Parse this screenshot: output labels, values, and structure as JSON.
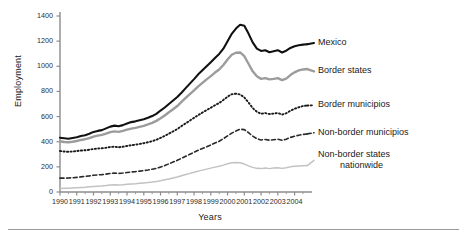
{
  "figure": {
    "bottom_rule": "horizontal-rule"
  },
  "chart_data": {
    "type": "line",
    "title": "",
    "xlabel": "Years",
    "ylabel": "Employment",
    "xlim": [
      1990,
      2004.92
    ],
    "ylim": [
      0,
      1400
    ],
    "grid": false,
    "legend_position": "right-of-line-ends",
    "yticks": [
      0,
      200,
      400,
      600,
      800,
      1000,
      1200,
      1400
    ],
    "ytick_labels": [
      "0",
      "200",
      "400",
      "600",
      "800",
      "1000",
      "1200",
      "1400"
    ],
    "xticks": [
      1990,
      1991,
      1992,
      1993,
      1994,
      1995,
      1996,
      1997,
      1998,
      1999,
      2000,
      2001,
      2002,
      2003,
      2004
    ],
    "xtick_labels": [
      "1990",
      "1991",
      "1992",
      "1993",
      "1994",
      "1995",
      "1996",
      "1997",
      "1998",
      "1999",
      "2000",
      "2001",
      "2002",
      "2003",
      "2004"
    ],
    "x": [
      1990.0,
      1990.25,
      1990.5,
      1990.75,
      1991.0,
      1991.25,
      1991.5,
      1991.75,
      1992.0,
      1992.25,
      1992.5,
      1992.75,
      1993.0,
      1993.25,
      1993.5,
      1993.75,
      1994.0,
      1994.25,
      1994.5,
      1994.75,
      1995.0,
      1995.25,
      1995.5,
      1995.75,
      1996.0,
      1996.25,
      1996.5,
      1996.75,
      1997.0,
      1997.25,
      1997.5,
      1997.75,
      1998.0,
      1998.25,
      1998.5,
      1998.75,
      1999.0,
      1999.25,
      1999.5,
      1999.75,
      2000.0,
      2000.25,
      2000.5,
      2000.75,
      2001.0,
      2001.25,
      2001.5,
      2001.75,
      2002.0,
      2002.25,
      2002.5,
      2002.75,
      2003.0,
      2003.25,
      2003.5,
      2003.75,
      2004.0,
      2004.25,
      2004.5,
      2004.75
    ],
    "series": [
      {
        "name": "Mexico",
        "style": "solid",
        "color": "#111111",
        "width": 2.1,
        "label_x": 2005.6,
        "label_y": 1185,
        "values": [
          432,
          428,
          424,
          430,
          436,
          445,
          452,
          463,
          478,
          486,
          492,
          506,
          520,
          528,
          523,
          532,
          545,
          556,
          562,
          570,
          578,
          590,
          604,
          622,
          648,
          672,
          700,
          728,
          756,
          790,
          826,
          862,
          898,
          936,
          968,
          1000,
          1032,
          1066,
          1098,
          1140,
          1200,
          1258,
          1300,
          1330,
          1322,
          1260,
          1190,
          1140,
          1122,
          1128,
          1112,
          1120,
          1128,
          1110,
          1124,
          1146,
          1160,
          1168,
          1172,
          1175
        ]
      },
      {
        "name": "Border states",
        "style": "solid",
        "color": "#9c9c9c",
        "width": 2.4,
        "label_x": 2005.6,
        "label_y": 960,
        "values": [
          404,
          398,
          396,
          400,
          406,
          414,
          420,
          428,
          440,
          448,
          454,
          464,
          476,
          482,
          478,
          486,
          496,
          504,
          510,
          518,
          526,
          538,
          550,
          566,
          586,
          608,
          634,
          658,
          684,
          716,
          748,
          778,
          808,
          840,
          868,
          896,
          922,
          950,
          974,
          1010,
          1054,
          1092,
          1108,
          1110,
          1080,
          1020,
          960,
          920,
          900,
          906,
          896,
          900,
          906,
          890,
          902,
          930,
          952,
          968,
          975,
          978
        ]
      },
      {
        "name": "Border municipios",
        "style": "dotted",
        "color": "#1a1a1a",
        "width": 1.9,
        "label_x": 2005.6,
        "label_y": 690,
        "values": [
          326,
          322,
          320,
          322,
          326,
          330,
          332,
          336,
          342,
          346,
          348,
          352,
          358,
          360,
          356,
          360,
          366,
          372,
          376,
          382,
          388,
          396,
          404,
          416,
          430,
          446,
          464,
          482,
          500,
          524,
          546,
          568,
          590,
          612,
          632,
          652,
          670,
          690,
          708,
          732,
          758,
          778,
          782,
          776,
          752,
          712,
          668,
          638,
          622,
          628,
          620,
          624,
          628,
          616,
          626,
          646,
          662,
          674,
          684,
          688
        ]
      },
      {
        "name": "Non-border municipios",
        "style": "dashed",
        "color": "#2a2a2a",
        "width": 1.6,
        "label_x": 2005.6,
        "label_y": 472,
        "values": [
          110,
          110,
          111,
          113,
          116,
          120,
          124,
          128,
          133,
          136,
          138,
          142,
          147,
          150,
          148,
          151,
          155,
          159,
          162,
          166,
          170,
          175,
          181,
          188,
          198,
          210,
          224,
          238,
          252,
          268,
          284,
          300,
          316,
          332,
          346,
          360,
          374,
          390,
          404,
          424,
          446,
          468,
          486,
          500,
          496,
          472,
          444,
          424,
          414,
          418,
          412,
          416,
          420,
          412,
          420,
          434,
          444,
          452,
          458,
          462
        ]
      },
      {
        "name": "Non-border states nationwide",
        "style": "solid",
        "color": "#c2c2c2",
        "width": 1.5,
        "label_x": 2005.6,
        "label_y": 252,
        "values": [
          28,
          29,
          30,
          32,
          34,
          36,
          38,
          41,
          44,
          46,
          48,
          51,
          55,
          57,
          56,
          58,
          61,
          64,
          66,
          69,
          72,
          75,
          79,
          84,
          90,
          97,
          104,
          112,
          120,
          130,
          139,
          148,
          157,
          166,
          174,
          182,
          190,
          198,
          205,
          214,
          224,
          232,
          234,
          232,
          222,
          208,
          196,
          188,
          186,
          190,
          186,
          190,
          193,
          188,
          193,
          200,
          204,
          207,
          209,
          210
        ]
      }
    ]
  }
}
